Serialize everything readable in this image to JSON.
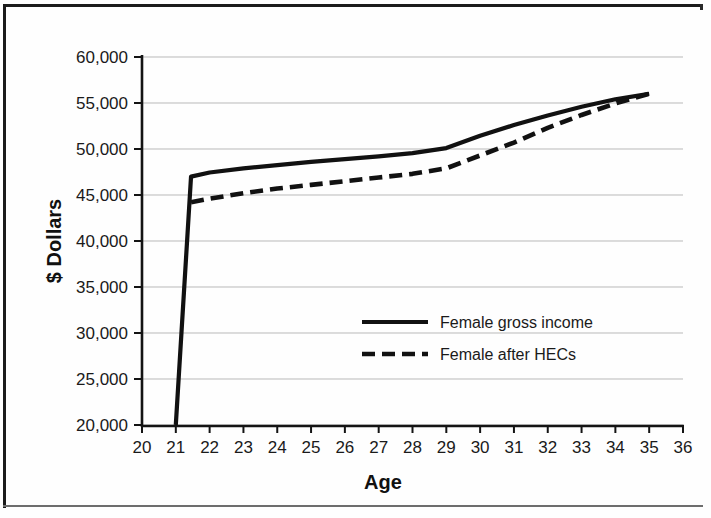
{
  "figure": {
    "background_color": "#fefefe",
    "border_color": "#1b1b1b"
  },
  "chart_data": {
    "type": "line",
    "title": "",
    "xlabel": "Age",
    "ylabel": "$ Dollars",
    "xlim": [
      20,
      36
    ],
    "ylim": [
      20000,
      60000
    ],
    "xticks": [
      20,
      21,
      22,
      23,
      24,
      25,
      26,
      27,
      28,
      29,
      30,
      31,
      32,
      33,
      34,
      35,
      36
    ],
    "xtick_labels": [
      "20",
      "21",
      "22",
      "23",
      "24",
      "25",
      "26",
      "27",
      "28",
      "29",
      "30",
      "31",
      "32",
      "33",
      "34",
      "35",
      "36"
    ],
    "yticks": [
      20000,
      25000,
      30000,
      35000,
      40000,
      45000,
      50000,
      55000,
      60000
    ],
    "ytick_labels": [
      "20,000",
      "25,000",
      "30,000",
      "35,000",
      "40,000",
      "45,000",
      "50,000",
      "55,000",
      "60,000"
    ],
    "grid": true,
    "grid_axis": "y",
    "grid_color": "#b9b9b9",
    "legend_position": "center",
    "series": [
      {
        "name": "Female gross income",
        "style": "solid",
        "color": "#111111",
        "x": [
          21.0,
          21.45,
          22.0,
          23.0,
          24.0,
          25.0,
          26.0,
          27.0,
          28.0,
          29.0,
          30.0,
          31.0,
          32.0,
          33.0,
          34.0,
          35.0
        ],
        "y": [
          20000,
          47000,
          47450,
          47900,
          48250,
          48600,
          48900,
          49200,
          49550,
          50100,
          51450,
          52600,
          53650,
          54600,
          55400,
          56000
        ]
      },
      {
        "name": "Female after HECs",
        "style": "dashed",
        "color": "#111111",
        "x": [
          21.45,
          22.0,
          23.0,
          24.0,
          25.0,
          26.0,
          27.0,
          28.0,
          29.0,
          30.0,
          31.0,
          32.0,
          33.0,
          34.0,
          35.0
        ],
        "y": [
          44200,
          44600,
          45200,
          45700,
          46100,
          46500,
          46900,
          47300,
          47900,
          49300,
          50700,
          52300,
          53700,
          54950,
          56000
        ]
      }
    ]
  },
  "legend": {
    "items": [
      {
        "label": "Female gross income",
        "style": "solid"
      },
      {
        "label": "Female after HECs",
        "style": "dashed"
      }
    ]
  }
}
